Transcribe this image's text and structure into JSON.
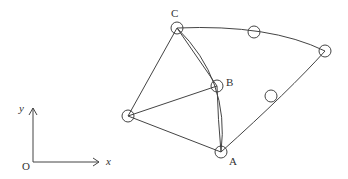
{
  "diagram": {
    "type": "finite-element-mesh-with-nodes",
    "stroke_color": "#444444",
    "background": "#ffffff",
    "axes": {
      "origin_label": "O",
      "x_label": "x",
      "y_label": "y"
    },
    "nodes": [
      {
        "id": "C",
        "label": "C",
        "x": 177,
        "y": 28
      },
      {
        "id": "B",
        "label": "B",
        "x": 217,
        "y": 86
      },
      {
        "id": "A",
        "label": "A",
        "x": 221,
        "y": 152
      },
      {
        "id": "L",
        "label": "",
        "x": 128,
        "y": 116
      },
      {
        "id": "T",
        "label": "",
        "x": 254,
        "y": 32
      },
      {
        "id": "R",
        "label": "",
        "x": 325,
        "y": 51
      },
      {
        "id": "M",
        "label": "",
        "x": 271,
        "y": 96
      }
    ],
    "edges": [
      {
        "from": "C",
        "to": "L",
        "kind": "straight"
      },
      {
        "from": "L",
        "to": "B",
        "kind": "straight"
      },
      {
        "from": "L",
        "to": "A",
        "kind": "straight"
      },
      {
        "from": "C",
        "to": "B",
        "kind": "straight"
      },
      {
        "from": "B",
        "to": "A",
        "kind": "straight"
      },
      {
        "from": "C",
        "to": "A",
        "kind": "curved"
      },
      {
        "from": "C",
        "to": "R",
        "kind": "curved",
        "via": "T"
      },
      {
        "from": "R",
        "to": "A",
        "kind": "curved",
        "via": "M"
      }
    ]
  }
}
